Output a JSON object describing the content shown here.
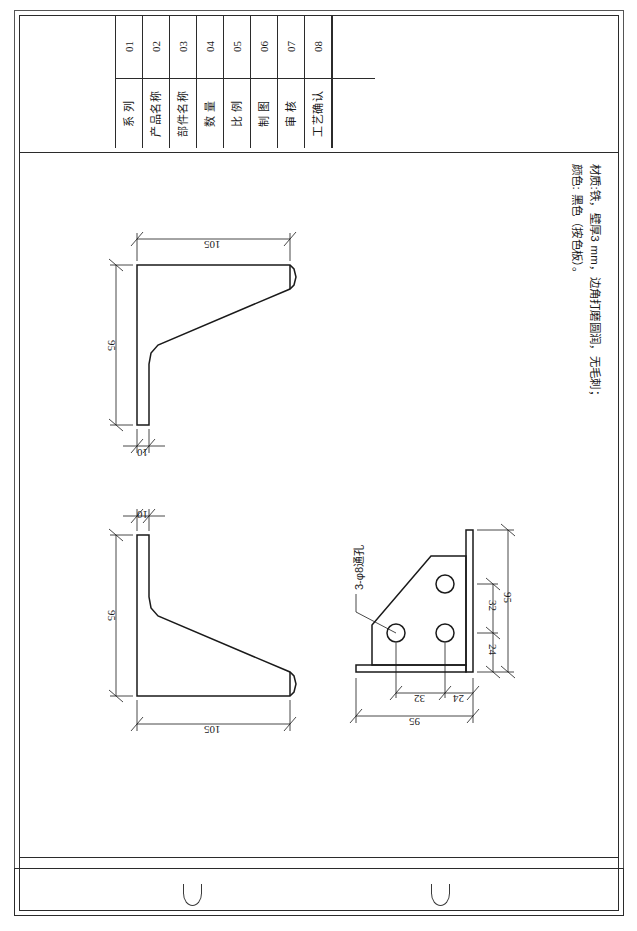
{
  "document": {
    "type": "engineering-drawing",
    "sheet_title": "",
    "language": "zh-CN"
  },
  "title_block": {
    "rows": [
      {
        "no": "01",
        "label": "系  列"
      },
      {
        "no": "02",
        "label": "产品名称"
      },
      {
        "no": "03",
        "label": "部件名称"
      },
      {
        "no": "04",
        "label": "数  量"
      },
      {
        "no": "05",
        "label": "比  例"
      },
      {
        "no": "06",
        "label": "制  图"
      },
      {
        "no": "07",
        "label": "审  核"
      },
      {
        "no": "08",
        "label": "工艺确认"
      }
    ]
  },
  "notes": {
    "line1": "材质:铁，壁厚3 mm，边角打磨圆润，无毛刺；",
    "line2": "颜色: 黑色（按色板）。"
  },
  "views": {
    "view1": {
      "name": "side-view-upper",
      "dims": {
        "width": "105",
        "height": "95",
        "thickness": "10"
      }
    },
    "view2": {
      "name": "side-view-lower",
      "dims": {
        "width": "105",
        "height": "95",
        "thickness": "10"
      }
    },
    "view3": {
      "name": "front-view-holes",
      "callout": "3-φ8通孔",
      "dims": {
        "overall_h": "95",
        "h_upper": "32",
        "h_lower": "24",
        "overall_w": "95",
        "w_left": "32",
        "w_right": "24"
      },
      "holes": [
        {
          "id": "hole-top-right"
        },
        {
          "id": "hole-bottom-left"
        },
        {
          "id": "hole-bottom-right"
        }
      ]
    }
  },
  "colors": {
    "line": "#1a1a1a",
    "frame": "#2b2b2b",
    "paper": "#ffffff"
  }
}
